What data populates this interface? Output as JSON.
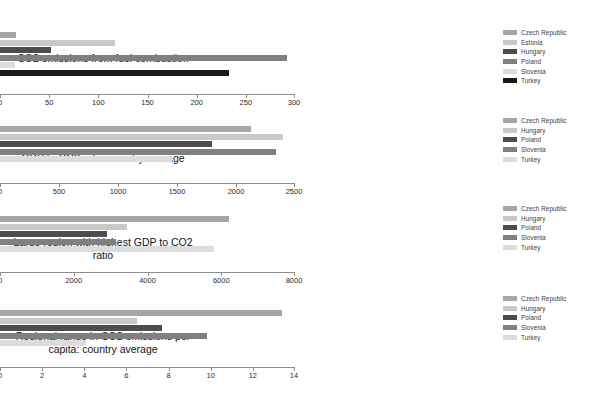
{
  "page": {
    "background_color": "#ffffff"
  },
  "palette": {
    "czech_republic": "#a6a6a6",
    "estonia": "#c9c9c9",
    "hungary": "#4d4d4d",
    "poland": "#808080",
    "slovenia": "#dcdcdc",
    "turkey": "#1a1a1a"
  },
  "charts": [
    {
      "id": "co2-emissions-fuel-combustion",
      "label": "CO2 emissions from fuel combustion",
      "legend": [
        {
          "name": "Czech Republic",
          "color": "#a6a6a6"
        },
        {
          "name": "Estonia",
          "color": "#c9c9c9"
        },
        {
          "name": "Hungary",
          "color": "#4d4d4d"
        },
        {
          "name": "Poland",
          "color": "#808080"
        },
        {
          "name": "Slovenia",
          "color": "#dcdcdc"
        },
        {
          "name": "Turkey",
          "color": "#1a1a1a"
        }
      ],
      "chart_data": {
        "type": "bar",
        "orientation": "horizontal",
        "title": "CO2 emissions from fuel combustion",
        "xlabel": "",
        "ylabel": "",
        "xlim": [
          0,
          300
        ],
        "xticks": [
          0,
          50,
          100,
          150,
          200,
          250,
          300
        ],
        "grid": false,
        "legend_position": "right",
        "categories": [
          "Czech Republic",
          "Estonia",
          "Hungary",
          "Poland",
          "Slovenia",
          "Turkey"
        ],
        "values": [
          16,
          117,
          52,
          292,
          15,
          233
        ]
      }
    },
    {
      "id": "gdp-to-co2-ratio-country-average",
      "label": "GDP to CO2 ratio: country average",
      "legend": [
        {
          "name": "Czech Republic",
          "color": "#a6a6a6"
        },
        {
          "name": "Hungary",
          "color": "#c9c9c9"
        },
        {
          "name": "Poland",
          "color": "#4d4d4d"
        },
        {
          "name": "Slovenia",
          "color": "#808080"
        },
        {
          "name": "Turkey",
          "color": "#dcdcdc"
        }
      ],
      "chart_data": {
        "type": "bar",
        "orientation": "horizontal",
        "title": "GDP to CO2 ratio: country average",
        "xlabel": "",
        "ylabel": "",
        "xlim": [
          0,
          2500
        ],
        "xticks": [
          0,
          500,
          1000,
          1500,
          2000,
          2500
        ],
        "grid": false,
        "legend_position": "right",
        "categories": [
          "Czech Republic",
          "Hungary",
          "Poland",
          "Slovenia",
          "Turkey"
        ],
        "values": [
          2130,
          2400,
          1800,
          2340,
          1460
        ]
      }
    },
    {
      "id": "large-region-highest-gdp-to-co2-ratio",
      "label": "Large region with highest GDP to CO2 ratio",
      "legend": [
        {
          "name": "Czech Republic",
          "color": "#a6a6a6"
        },
        {
          "name": "Hungary",
          "color": "#c9c9c9"
        },
        {
          "name": "Poland",
          "color": "#4d4d4d"
        },
        {
          "name": "Slovenia",
          "color": "#808080"
        },
        {
          "name": "Turkey",
          "color": "#dcdcdc"
        }
      ],
      "chart_data": {
        "type": "bar",
        "orientation": "horizontal",
        "title": "Large region with highest GDP to CO2 ratio",
        "xlabel": "",
        "ylabel": "",
        "xlim": [
          0,
          8000
        ],
        "xticks": [
          0,
          2000,
          4000,
          6000,
          8000
        ],
        "grid": false,
        "legend_position": "right",
        "categories": [
          "Czech Republic",
          "Hungary",
          "Poland",
          "Slovenia",
          "Turkey"
        ],
        "values": [
          6200,
          3450,
          2900,
          3150,
          5800
        ]
      }
    },
    {
      "id": "regional-range-co2-per-capita-country-average",
      "label": "Regional range in CO2 emissions per capita: country average",
      "legend": [
        {
          "name": "Czech Republic",
          "color": "#a6a6a6"
        },
        {
          "name": "Hungary",
          "color": "#c9c9c9"
        },
        {
          "name": "Poland",
          "color": "#4d4d4d"
        },
        {
          "name": "Slovenia",
          "color": "#808080"
        },
        {
          "name": "Turkey",
          "color": "#dcdcdc"
        }
      ],
      "chart_data": {
        "type": "bar",
        "orientation": "horizontal",
        "title": "Regional range in CO2 emissions per capita: country average",
        "xlabel": "",
        "ylabel": "",
        "xlim": [
          0,
          14
        ],
        "xticks": [
          0,
          2,
          4,
          6,
          8,
          10,
          12,
          14
        ],
        "grid": false,
        "legend_position": "right",
        "categories": [
          "Czech Republic",
          "Hungary",
          "Poland",
          "Slovenia",
          "Turkey"
        ],
        "values": [
          13.4,
          6.5,
          7.7,
          9.8,
          4.1
        ]
      }
    }
  ]
}
